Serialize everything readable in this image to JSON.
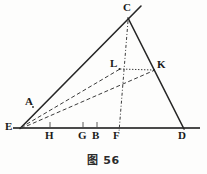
{
  "figure": {
    "caption": "图 56",
    "caption_label": "图",
    "caption_number": "56",
    "background_color": "#fdfdfc",
    "stroke_color": "#262626",
    "baseline_color": "#4a4a4a"
  },
  "points": [
    {
      "id": "C",
      "name": "point-c",
      "label": "C",
      "x": 128,
      "y": 18,
      "label_x": 123,
      "label_y": 3,
      "type": "apex"
    },
    {
      "id": "A",
      "name": "point-a",
      "label": "A",
      "x": 33,
      "y": 107,
      "label_x": 25,
      "label_y": 97,
      "type": "on-segment"
    },
    {
      "id": "E",
      "name": "point-e",
      "label": "E",
      "x": 20,
      "y": 128,
      "label_x": 6,
      "label_y": 122,
      "type": "vertex"
    },
    {
      "id": "D",
      "name": "point-d",
      "label": "D",
      "x": 183,
      "y": 128,
      "label_x": 179,
      "label_y": 131,
      "type": "vertex"
    },
    {
      "id": "L",
      "name": "point-l",
      "label": "L",
      "x": 119,
      "y": 69,
      "label_x": 110,
      "label_y": 59,
      "type": "interior"
    },
    {
      "id": "K",
      "name": "point-k",
      "label": "K",
      "x": 154,
      "y": 70,
      "label_x": 157,
      "label_y": 60,
      "type": "on-segment"
    },
    {
      "id": "H",
      "name": "point-h",
      "label": "H",
      "x": 50,
      "y": 128,
      "label_x": 45,
      "label_y": 131,
      "type": "on-baseline"
    },
    {
      "id": "G",
      "name": "point-g",
      "label": "G",
      "x": 83,
      "y": 128,
      "label_x": 78,
      "label_y": 131,
      "type": "on-baseline"
    },
    {
      "id": "B",
      "name": "point-b",
      "label": "B",
      "x": 97,
      "y": 128,
      "label_x": 93,
      "label_y": 131,
      "type": "on-baseline"
    },
    {
      "id": "F",
      "name": "point-f",
      "label": "F",
      "x": 119,
      "y": 128,
      "label_x": 114,
      "label_y": 131,
      "type": "on-baseline"
    }
  ],
  "segments": [
    {
      "name": "ray-e-c-extended",
      "from": "E",
      "to": "C",
      "x1": 20,
      "y1": 128,
      "x2": 140,
      "y2": 7,
      "style": "solid",
      "width": 1.6
    },
    {
      "name": "segment-c-d",
      "from": "C",
      "to": "D",
      "x1": 128,
      "y1": 18,
      "x2": 184,
      "y2": 129,
      "style": "solid",
      "width": 1.6
    },
    {
      "name": "baseline-e-d",
      "from": "E",
      "to": "D",
      "x1": 13,
      "y1": 128,
      "x2": 200,
      "y2": 128,
      "style": "solid",
      "width": 2.1
    },
    {
      "name": "axis-c-f",
      "from": "C",
      "to": "F",
      "x1": 128,
      "y1": 20,
      "x2": 119,
      "y2": 131,
      "style": "dashdot",
      "width": 1.0
    },
    {
      "name": "segment-e-l",
      "from": "E",
      "to": "L",
      "x1": 21,
      "y1": 128,
      "x2": 120,
      "y2": 69,
      "style": "dashed",
      "width": 1.0
    },
    {
      "name": "segment-e-k",
      "from": "E",
      "to": "K",
      "x1": 21,
      "y1": 129,
      "x2": 155,
      "y2": 70,
      "style": "dashed",
      "width": 1.0
    },
    {
      "name": "segment-l-k",
      "from": "L",
      "to": "K",
      "x1": 120,
      "y1": 69,
      "x2": 154,
      "y2": 70,
      "style": "dotted",
      "width": 1.0
    }
  ],
  "tick_marks": [
    {
      "name": "tick-h",
      "at": "H",
      "x": 50,
      "y": 128
    },
    {
      "name": "tick-g",
      "at": "G",
      "x": 83,
      "y": 128
    },
    {
      "name": "tick-b",
      "at": "B",
      "x": 97,
      "y": 128
    },
    {
      "name": "tick-f",
      "at": "F",
      "x": 119,
      "y": 128
    }
  ]
}
